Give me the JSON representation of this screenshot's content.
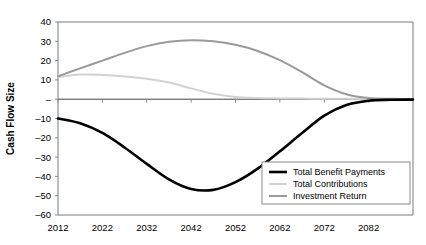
{
  "chart_data": {
    "type": "line",
    "title": "",
    "xlabel": "",
    "ylabel": "Cash Flow Size",
    "xlim": [
      2012,
      2092
    ],
    "ylim": [
      -60,
      40
    ],
    "ytick_labels": [
      "40",
      "30",
      "20",
      "10",
      "–",
      "–10",
      "–20",
      "–30",
      "–40",
      "–50",
      "–60"
    ],
    "ytick_values": [
      40,
      30,
      20,
      10,
      0,
      -10,
      -20,
      -30,
      -40,
      -50,
      -60
    ],
    "xtick_labels": [
      "2012",
      "2022",
      "2032",
      "2042",
      "2052",
      "2062",
      "2072",
      "2082"
    ],
    "xtick_values": [
      2012,
      2022,
      2032,
      2042,
      2052,
      2062,
      2072,
      2082
    ],
    "grid": false,
    "legend_position": "bottom-right",
    "x": [
      2012,
      2017,
      2022,
      2027,
      2032,
      2037,
      2042,
      2047,
      2052,
      2057,
      2062,
      2067,
      2072,
      2077,
      2082,
      2087,
      2092
    ],
    "series": [
      {
        "name": "Total Benefit Payments",
        "color": "#000000",
        "width": 2.6,
        "values": [
          -10.0,
          -12.5,
          -17.5,
          -25.0,
          -33.5,
          -41.5,
          -46.5,
          -47.0,
          -43.0,
          -36.0,
          -27.0,
          -17.5,
          -8.5,
          -3.0,
          -0.8,
          -0.3,
          -0.2
        ]
      },
      {
        "name": "Total Contributions",
        "color": "#d2d2d2",
        "width": 2.0,
        "values": [
          11.5,
          12.8,
          12.6,
          11.8,
          10.6,
          8.6,
          5.6,
          2.8,
          1.2,
          0.6,
          0.4,
          0.3,
          0.2,
          0.2,
          0.1,
          0.1,
          0.1
        ]
      },
      {
        "name": "Investment Return",
        "color": "#9a9a9a",
        "width": 2.0,
        "values": [
          11.8,
          16.0,
          20.0,
          24.0,
          27.5,
          29.8,
          30.6,
          30.0,
          28.2,
          25.0,
          20.2,
          14.0,
          7.2,
          2.6,
          0.6,
          0.2,
          0.1
        ]
      }
    ]
  },
  "legend": {
    "items": [
      {
        "label": "Total Benefit Payments"
      },
      {
        "label": "Total Contributions"
      },
      {
        "label": "Investment Return"
      }
    ]
  }
}
